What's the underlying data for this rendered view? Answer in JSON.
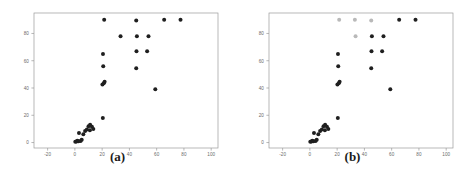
{
  "figure": {
    "background": "#ffffff",
    "panels": [
      {
        "caption": "(a)",
        "chart_data": {
          "type": "scatter",
          "title": "",
          "xlabel": "",
          "ylabel": "",
          "xlim": [
            -30,
            105
          ],
          "ylim": [
            -4,
            95
          ],
          "xticks": [
            -20,
            0,
            20,
            40,
            60,
            80,
            100
          ],
          "xtick_labels": [
            "-20",
            "0",
            "20",
            "40",
            "60",
            "80",
            "100"
          ],
          "yticks": [
            0,
            20,
            40,
            60,
            80
          ],
          "ytick_labels": [
            "0",
            "20",
            "40",
            "60",
            "80"
          ],
          "grid": false,
          "legend": "none",
          "marker_color": "#1f1f1f",
          "marker_size": 3.1,
          "series": [
            {
              "name": "observations",
              "color": "#1f1f1f",
              "points": [
                [
                  0.3,
                  0.5
                ],
                [
                  1.2,
                  0.8
                ],
                [
                  1.8,
                  1.4
                ],
                [
                  2.6,
                  0.9
                ],
                [
                  4.2,
                  1.2
                ],
                [
                  5.0,
                  2.0
                ],
                [
                  3.0,
                  7.0
                ],
                [
                  6.2,
                  6.0
                ],
                [
                  7.5,
                  8.5
                ],
                [
                  8.8,
                  9.5
                ],
                [
                  10.0,
                  12.0
                ],
                [
                  11.2,
                  13.0
                ],
                [
                  12.5,
                  11.5
                ],
                [
                  13.5,
                  10.0
                ],
                [
                  11.0,
                  9.0
                ],
                [
                  20.5,
                  18.0
                ],
                [
                  20.2,
                  42.5
                ],
                [
                  21.2,
                  43.5
                ],
                [
                  21.8,
                  44.5
                ],
                [
                  20.8,
                  56.0
                ],
                [
                  20.6,
                  65.0
                ],
                [
                  21.5,
                  90.0
                ],
                [
                  33.5,
                  78.0
                ],
                [
                  45.0,
                  54.5
                ],
                [
                  45.2,
                  67.0
                ],
                [
                  45.5,
                  78.0
                ],
                [
                  45.0,
                  89.5
                ],
                [
                  53.0,
                  67.0
                ],
                [
                  54.0,
                  78.0
                ],
                [
                  59.0,
                  39.0
                ],
                [
                  65.5,
                  90.0
                ],
                [
                  77.5,
                  90.0
                ]
              ]
            }
          ]
        }
      },
      {
        "caption": "(b)",
        "chart_data": {
          "type": "scatter",
          "title": "",
          "xlabel": "",
          "ylabel": "",
          "xlim": [
            -30,
            105
          ],
          "ylim": [
            -4,
            95
          ],
          "xticks": [
            -20,
            0,
            20,
            40,
            60,
            80,
            100
          ],
          "xtick_labels": [
            "-20",
            "0",
            "20",
            "40",
            "60",
            "80",
            "100"
          ],
          "yticks": [
            0,
            20,
            40,
            60,
            80
          ],
          "ytick_labels": [
            "0",
            "20",
            "40",
            "60",
            "80"
          ],
          "grid": false,
          "legend": "none",
          "marker_color": "#1f1f1f",
          "marker_color_faded": "#b9b9b9",
          "marker_size": 3.1,
          "series": [
            {
              "name": "observations-dark",
              "color": "#1f1f1f",
              "points": [
                [
                  0.3,
                  0.5
                ],
                [
                  1.2,
                  0.8
                ],
                [
                  1.8,
                  1.4
                ],
                [
                  2.6,
                  0.9
                ],
                [
                  4.2,
                  1.2
                ],
                [
                  5.0,
                  2.0
                ],
                [
                  3.0,
                  7.0
                ],
                [
                  6.2,
                  6.0
                ],
                [
                  7.5,
                  8.5
                ],
                [
                  8.8,
                  9.5
                ],
                [
                  10.0,
                  12.0
                ],
                [
                  11.2,
                  13.0
                ],
                [
                  12.5,
                  11.5
                ],
                [
                  13.5,
                  10.0
                ],
                [
                  11.0,
                  9.0
                ],
                [
                  20.5,
                  18.0
                ],
                [
                  20.2,
                  42.5
                ],
                [
                  21.2,
                  43.5
                ],
                [
                  21.8,
                  44.5
                ],
                [
                  20.8,
                  56.0
                ],
                [
                  20.6,
                  65.0
                ],
                [
                  45.0,
                  54.5
                ],
                [
                  45.2,
                  67.0
                ],
                [
                  45.5,
                  78.0
                ],
                [
                  53.0,
                  67.0
                ],
                [
                  54.0,
                  78.0
                ],
                [
                  59.0,
                  39.0
                ],
                [
                  65.5,
                  90.0
                ],
                [
                  77.5,
                  90.0
                ]
              ]
            },
            {
              "name": "observations-faded",
              "color": "#b9b9b9",
              "points": [
                [
                  21.5,
                  90.0
                ],
                [
                  33.5,
                  78.0
                ],
                [
                  45.0,
                  89.5
                ],
                [
                  33.0,
                  90.0
                ]
              ]
            }
          ]
        }
      }
    ]
  }
}
